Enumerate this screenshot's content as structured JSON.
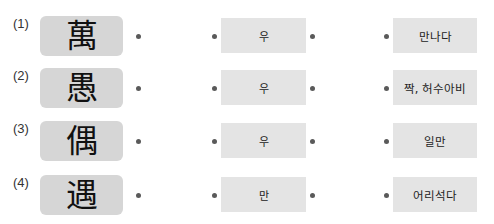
{
  "rows": [
    {
      "number": "(1)",
      "hanja": "萬",
      "reading": "우",
      "meaning": "만나다"
    },
    {
      "number": "(2)",
      "hanja": "愚",
      "reading": "우",
      "meaning": "짝, 허수아비"
    },
    {
      "number": "(3)",
      "hanja": "偶",
      "reading": "우",
      "meaning": "일만"
    },
    {
      "number": "(4)",
      "hanja": "遇",
      "reading": "만",
      "meaning": "어리석다"
    }
  ],
  "colors": {
    "hanja_box": "#d6d6d6",
    "option_box": "#e4e4e4",
    "dot": "#5a5a5a"
  }
}
